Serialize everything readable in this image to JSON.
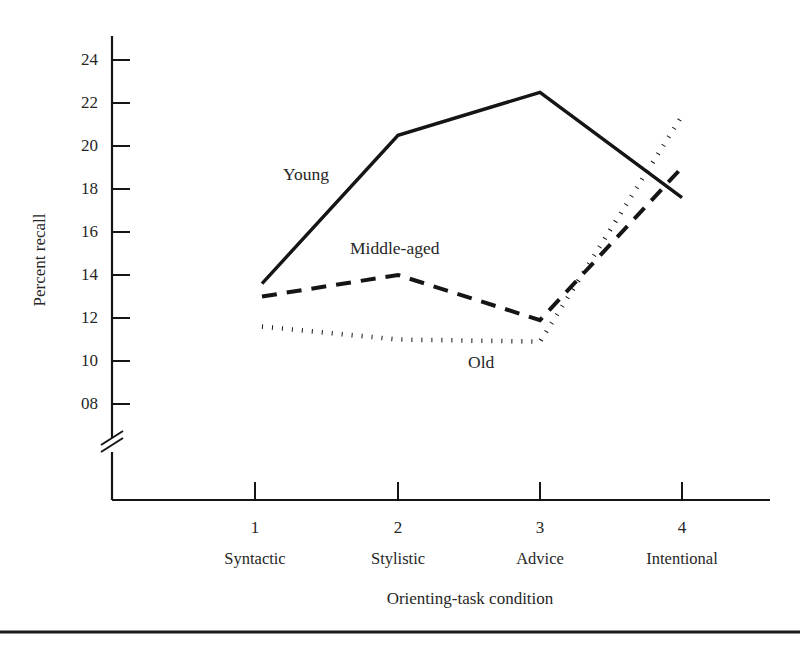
{
  "chart_data": {
    "type": "line",
    "title": "",
    "xlabel": "Orienting-task condition",
    "ylabel": "Percent recall",
    "categories": [
      "1",
      "2",
      "3",
      "4"
    ],
    "category_names": [
      "Syntactic",
      "Stylistic",
      "Advice",
      "Intentional"
    ],
    "yticks": [
      "08",
      "10",
      "12",
      "14",
      "16",
      "18",
      "20",
      "22",
      "24"
    ],
    "ytick_values": [
      8,
      10,
      12,
      14,
      16,
      18,
      20,
      22,
      24
    ],
    "ylim": [
      8,
      25
    ],
    "y_axis_break": true,
    "grid": false,
    "legend": "inline-labels",
    "series": [
      {
        "name": "Young",
        "style": "solid",
        "color": "#151515",
        "values": [
          13.6,
          20.5,
          22.5,
          17.6
        ]
      },
      {
        "name": "Middle-aged",
        "style": "dashed",
        "color": "#151515",
        "values": [
          13.0,
          14.0,
          11.9,
          19.0
        ]
      },
      {
        "name": "Old",
        "style": "dotted",
        "color": "#151515",
        "values": [
          11.6,
          11.0,
          10.9,
          21.4
        ]
      }
    ]
  },
  "axis": {
    "y_title": "Percent recall",
    "x_title": "Orienting-task condition"
  },
  "series_labels": {
    "young": "Young",
    "middle_aged": "Middle-aged",
    "old": "Old"
  },
  "ytick_labels": {
    "t24": "24",
    "t22": "22",
    "t20": "20",
    "t18": "18",
    "t16": "16",
    "t14": "14",
    "t12": "12",
    "t10": "10",
    "t08": "08"
  },
  "xtick_numbers": {
    "n1": "1",
    "n2": "2",
    "n3": "3",
    "n4": "4"
  },
  "xtick_names": {
    "c1": "Syntactic",
    "c2": "Stylistic",
    "c3": "Advice",
    "c4": "Intentional"
  },
  "colors": {
    "ink": "#151515",
    "text": "#262626",
    "background": "#ffffff"
  }
}
